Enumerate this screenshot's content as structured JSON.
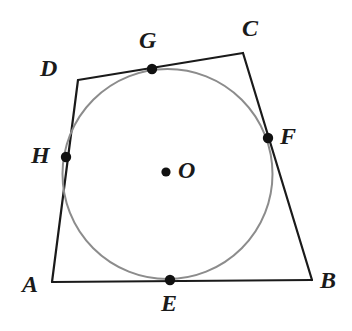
{
  "figure": {
    "kind": "geometry-diagram",
    "canvas": {
      "width": 352,
      "height": 331
    },
    "colors": {
      "background": "#ffffff",
      "polygon_stroke": "#1a1a1a",
      "circle_stroke": "#8c8c8c",
      "point_fill": "#111111",
      "label_text": "#1a1a1a"
    },
    "strokes": {
      "polygon_width": 2.2,
      "circle_width": 2.0,
      "point_radius": 5.2,
      "center_point_radius": 4.6
    }
  },
  "circle": {
    "name": "inscribed-circle",
    "center_x": 167.5,
    "center_y": 174,
    "radius": 105
  },
  "center": {
    "point_name": "O",
    "x": 166,
    "y": 172,
    "label": "O",
    "label_x": 178,
    "label_y": 158
  },
  "vertices": [
    {
      "name": "A",
      "label": "A",
      "x": 52,
      "y": 282,
      "label_x": 22,
      "label_y": 272
    },
    {
      "name": "B",
      "label": "B",
      "x": 312,
      "y": 280,
      "label_x": 320,
      "label_y": 268
    },
    {
      "name": "C",
      "label": "C",
      "x": 243,
      "y": 53,
      "label_x": 242,
      "label_y": 16
    },
    {
      "name": "D",
      "label": "D",
      "x": 78,
      "y": 80,
      "label_x": 40,
      "label_y": 56
    }
  ],
  "tangent_points": [
    {
      "name": "E",
      "label": "E",
      "side": "AB",
      "x": 170,
      "y": 280,
      "label_x": 161,
      "label_y": 291
    },
    {
      "name": "F",
      "label": "F",
      "side": "BC",
      "x": 268,
      "y": 138,
      "label_x": 280,
      "label_y": 124
    },
    {
      "name": "G",
      "label": "G",
      "side": "CD",
      "x": 152,
      "y": 69,
      "label_x": 139,
      "label_y": 28
    },
    {
      "name": "H",
      "label": "H",
      "side": "DA",
      "x": 66,
      "y": 157,
      "label_x": 31,
      "label_y": 143
    }
  ],
  "edges": [
    {
      "name": "AB",
      "from": "A",
      "to": "B"
    },
    {
      "name": "BC",
      "from": "B",
      "to": "C"
    },
    {
      "name": "CD",
      "from": "C",
      "to": "D"
    },
    {
      "name": "DA",
      "from": "D",
      "to": "A"
    }
  ]
}
